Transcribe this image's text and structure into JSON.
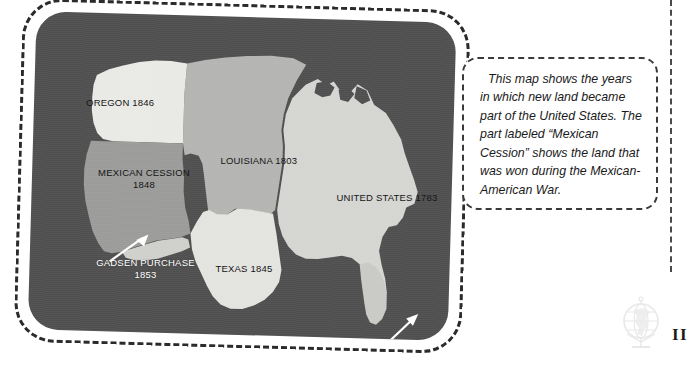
{
  "page": {
    "page_number": "II",
    "watermark_icon": "globe-icon"
  },
  "map": {
    "title_alt": "United States territorial acquisitions map",
    "background_color": "#4f4f4f",
    "regions": [
      {
        "id": "oregon",
        "name": "OREGON",
        "year": "1846",
        "fill": "#e9e9e6",
        "label_color": "#111111"
      },
      {
        "id": "louisiana",
        "name": "LOUISIANA",
        "year": "1803",
        "fill": "#b4b4b2",
        "label_color": "#111111"
      },
      {
        "id": "mexican",
        "name": "MEXICAN CESSION",
        "year": "1848",
        "fill": "#9b9b99",
        "label_color": "#111111"
      },
      {
        "id": "united",
        "name": "UNITED STATES",
        "year": "1783",
        "fill": "#d5d5d2",
        "label_color": "#111111"
      },
      {
        "id": "texas",
        "name": "TEXAS",
        "year": "1845",
        "fill": "#e3e3e0",
        "label_color": "#111111"
      },
      {
        "id": "gadsden",
        "name": "GADSEN PURCHASE",
        "year": "1853",
        "fill": "#cfcfcc",
        "label_color": "#ffffff"
      },
      {
        "id": "florida",
        "name": "FLORIDA",
        "year": "1819",
        "fill": "#c9c9c6",
        "label_color": "#ffffff"
      }
    ],
    "labels": {
      "oregon": "OREGON 1846",
      "louisiana": "LOUISIANA 1803",
      "mexican_line1": "MEXICAN CESSION",
      "mexican_line2": "1848",
      "united_states": "UNITED STATES 1783",
      "texas": "TEXAS 1845",
      "gadsden_line1": "GADSEN PURCHASE",
      "gadsden_line2": "1853",
      "florida": "FLORIDA 1819"
    }
  },
  "callout": {
    "text": "This map shows the years in which new land became part of the United States. The part labeled “Mexican Cession” shows the land that was won during the Mexican-American War."
  }
}
